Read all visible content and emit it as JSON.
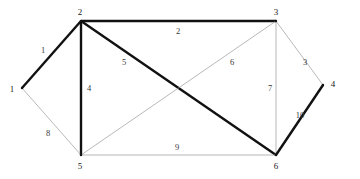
{
  "figure": {
    "type": "weighted-undirected-graph",
    "background_color": "#ffffff",
    "thick_edge_color": "#111111",
    "thin_edge_color": "#9a9a9a",
    "thick_edge_width": 2.4,
    "thin_edge_width": 0.7
  },
  "nodes": [
    {
      "id": "1",
      "label": "1",
      "x": 22,
      "y": 88,
      "label_x": 12,
      "label_y": 89
    },
    {
      "id": "2",
      "label": "2",
      "x": 81,
      "y": 21,
      "label_x": 80,
      "label_y": 12
    },
    {
      "id": "3",
      "label": "3",
      "x": 276,
      "y": 21,
      "label_x": 276,
      "label_y": 12
    },
    {
      "id": "4",
      "label": "4",
      "x": 323,
      "y": 85,
      "label_x": 333,
      "label_y": 84
    },
    {
      "id": "5",
      "label": "5",
      "x": 81,
      "y": 155,
      "label_x": 80,
      "label_y": 166
    },
    {
      "id": "6",
      "label": "6",
      "x": 276,
      "y": 155,
      "label_x": 276,
      "label_y": 166
    }
  ],
  "edges": [
    {
      "id": "e1",
      "from": "1",
      "to": "2",
      "weight": "1",
      "style": "thick",
      "label_x": 43,
      "label_y": 50
    },
    {
      "id": "e2",
      "from": "2",
      "to": "3",
      "weight": "2",
      "style": "thick",
      "label_x": 178,
      "label_y": 31
    },
    {
      "id": "e3",
      "from": "3",
      "to": "4",
      "weight": "3",
      "style": "thin",
      "label_x": 305,
      "label_y": 62
    },
    {
      "id": "e4",
      "from": "2",
      "to": "5",
      "weight": "4",
      "style": "thick",
      "label_x": 89,
      "label_y": 88
    },
    {
      "id": "e5",
      "from": "2",
      "to": "6",
      "weight": "5",
      "style": "thick",
      "label_x": 124,
      "label_y": 62
    },
    {
      "id": "e6",
      "from": "3",
      "to": "5",
      "weight": "6",
      "style": "thin",
      "label_x": 232,
      "label_y": 62
    },
    {
      "id": "e7",
      "from": "3",
      "to": "6",
      "weight": "7",
      "style": "thin",
      "label_x": 270,
      "label_y": 88
    },
    {
      "id": "e8",
      "from": "1",
      "to": "5",
      "weight": "8",
      "style": "thin",
      "label_x": 48,
      "label_y": 133
    },
    {
      "id": "e9",
      "from": "5",
      "to": "6",
      "weight": "9",
      "style": "thin",
      "label_x": 177,
      "label_y": 147
    },
    {
      "id": "e10",
      "from": "4",
      "to": "6",
      "weight": "10",
      "style": "thick",
      "label_x": 300,
      "label_y": 115
    }
  ]
}
